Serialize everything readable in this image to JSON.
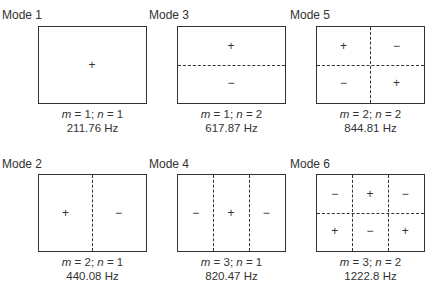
{
  "figure": {
    "modes": [
      {
        "id": 1,
        "title": "Mode 1",
        "m": "1",
        "n": "1",
        "freq": "211.76 Hz",
        "cells": [
          [
            "+"
          ]
        ]
      },
      {
        "id": 3,
        "title": "Mode 3",
        "m": "1",
        "n": "2",
        "freq": "617.87 Hz",
        "cells": [
          [
            "+"
          ],
          [
            "−"
          ]
        ]
      },
      {
        "id": 5,
        "title": "Mode 5",
        "m": "2",
        "n": "2",
        "freq": "844.81 Hz",
        "cells": [
          [
            "+",
            "−"
          ],
          [
            "−",
            "+"
          ]
        ]
      },
      {
        "id": 2,
        "title": "Mode 2",
        "m": "2",
        "n": "1",
        "freq": "440.08 Hz",
        "cells": [
          [
            "+",
            "−"
          ]
        ]
      },
      {
        "id": 4,
        "title": "Mode 4",
        "m": "3",
        "n": "1",
        "freq": "820.47 Hz",
        "cells": [
          [
            "−",
            "+",
            "−"
          ]
        ]
      },
      {
        "id": 6,
        "title": "Mode 6",
        "m": "3",
        "n": "2",
        "freq": "1222.8 Hz",
        "cells": [
          [
            "−",
            "+",
            "−"
          ],
          [
            "+",
            "−",
            "+"
          ]
        ]
      }
    ],
    "labels": {
      "m": "m",
      "n": "n",
      "eq": " = ",
      "sep": "; "
    }
  }
}
